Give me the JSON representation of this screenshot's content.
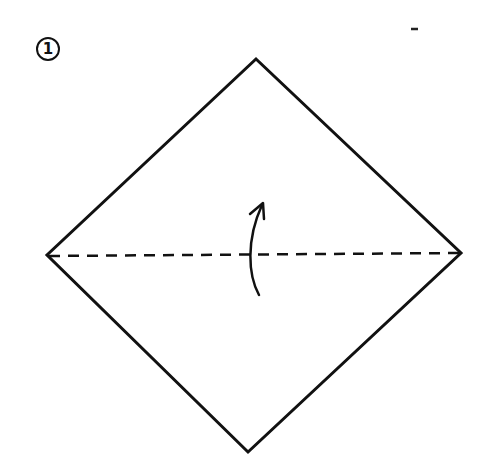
{
  "diagram": {
    "type": "origami-instruction",
    "step": {
      "number": "1"
    },
    "shapes": {
      "paper": {
        "kind": "square-diamond",
        "corners": {
          "top": [
            256,
            59
          ],
          "right": [
            461,
            253
          ],
          "bottom": [
            248,
            452
          ],
          "left": [
            47,
            255
          ]
        },
        "stroke_color": "#111111"
      },
      "fold_line": {
        "kind": "valley-fold",
        "style": "dashed",
        "from": [
          47,
          255
        ],
        "to": [
          461,
          253
        ]
      },
      "arrow": {
        "kind": "fold-direction",
        "direction": "up",
        "description": "fold bottom corner up to top corner"
      }
    },
    "stray_mark": [
      414,
      29
    ]
  }
}
